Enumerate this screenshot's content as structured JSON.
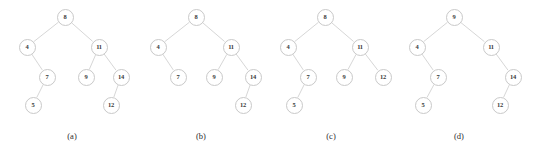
{
  "figure": {
    "background_color": "#ffffff",
    "node_fill": "#ffffff",
    "node_stroke": "#c9c9c9",
    "edge_color": "#cccccc",
    "text_color": "#3a3a3a",
    "width": 539,
    "height": 151
  },
  "chart_data": {
    "type": "diagram",
    "subtype": "binary-search-tree",
    "title": "",
    "panel_count": 4,
    "panels": [
      {
        "caption": "(a)",
        "caption_x": 72,
        "caption_y": 131,
        "root": "8",
        "nodes": [
          {
            "id": "a8",
            "label": "8",
            "x": 65,
            "y": 17
          },
          {
            "id": "a4",
            "label": "4",
            "x": 27,
            "y": 47
          },
          {
            "id": "a11",
            "label": "11",
            "x": 99,
            "y": 47
          },
          {
            "id": "a7",
            "label": "7",
            "x": 47,
            "y": 77
          },
          {
            "id": "a9",
            "label": "9",
            "x": 86,
            "y": 77
          },
          {
            "id": "a14",
            "label": "14",
            "x": 121,
            "y": 77
          },
          {
            "id": "a5",
            "label": "5",
            "x": 33,
            "y": 105
          },
          {
            "id": "a12",
            "label": "12",
            "x": 111,
            "y": 105
          }
        ],
        "edges": [
          {
            "from": "a8",
            "to": "a4"
          },
          {
            "from": "a8",
            "to": "a11"
          },
          {
            "from": "a4",
            "to": "a7"
          },
          {
            "from": "a11",
            "to": "a9"
          },
          {
            "from": "a11",
            "to": "a14"
          },
          {
            "from": "a7",
            "to": "a5"
          },
          {
            "from": "a14",
            "to": "a12"
          }
        ]
      },
      {
        "caption": "(b)",
        "caption_x": 201,
        "caption_y": 131,
        "root": "8",
        "nodes": [
          {
            "id": "b8",
            "label": "8",
            "x": 196,
            "y": 17
          },
          {
            "id": "b4",
            "label": "4",
            "x": 158,
            "y": 47
          },
          {
            "id": "b11",
            "label": "11",
            "x": 231,
            "y": 47
          },
          {
            "id": "b7",
            "label": "7",
            "x": 178,
            "y": 77
          },
          {
            "id": "b9",
            "label": "9",
            "x": 214,
            "y": 77
          },
          {
            "id": "b14",
            "label": "14",
            "x": 253,
            "y": 77
          },
          {
            "id": "b12",
            "label": "12",
            "x": 243,
            "y": 105
          }
        ],
        "edges": [
          {
            "from": "b8",
            "to": "b4"
          },
          {
            "from": "b8",
            "to": "b11"
          },
          {
            "from": "b4",
            "to": "b7"
          },
          {
            "from": "b11",
            "to": "b9"
          },
          {
            "from": "b11",
            "to": "b14"
          },
          {
            "from": "b14",
            "to": "b12"
          }
        ]
      },
      {
        "caption": "(c)",
        "caption_x": 331,
        "caption_y": 131,
        "root": "8",
        "nodes": [
          {
            "id": "c8",
            "label": "8",
            "x": 325,
            "y": 17
          },
          {
            "id": "c4",
            "label": "4",
            "x": 288,
            "y": 47
          },
          {
            "id": "c11",
            "label": "11",
            "x": 360,
            "y": 47
          },
          {
            "id": "c7",
            "label": "7",
            "x": 308,
            "y": 77
          },
          {
            "id": "c9",
            "label": "9",
            "x": 344,
            "y": 77
          },
          {
            "id": "c12",
            "label": "12",
            "x": 383,
            "y": 77
          },
          {
            "id": "c5",
            "label": "5",
            "x": 294,
            "y": 105
          }
        ],
        "edges": [
          {
            "from": "c8",
            "to": "c4"
          },
          {
            "from": "c8",
            "to": "c11"
          },
          {
            "from": "c4",
            "to": "c7"
          },
          {
            "from": "c11",
            "to": "c9"
          },
          {
            "from": "c11",
            "to": "c12"
          },
          {
            "from": "c7",
            "to": "c5"
          }
        ]
      },
      {
        "caption": "(d)",
        "caption_x": 459,
        "caption_y": 131,
        "root": "9",
        "nodes": [
          {
            "id": "d9",
            "label": "9",
            "x": 454,
            "y": 17
          },
          {
            "id": "d4",
            "label": "4",
            "x": 417,
            "y": 47
          },
          {
            "id": "d11",
            "label": "11",
            "x": 491,
            "y": 47
          },
          {
            "id": "d7",
            "label": "7",
            "x": 438,
            "y": 77
          },
          {
            "id": "d14",
            "label": "14",
            "x": 513,
            "y": 77
          },
          {
            "id": "d5",
            "label": "5",
            "x": 423,
            "y": 105
          },
          {
            "id": "d12",
            "label": "12",
            "x": 500,
            "y": 105
          }
        ],
        "edges": [
          {
            "from": "d9",
            "to": "d4"
          },
          {
            "from": "d9",
            "to": "d11"
          },
          {
            "from": "d4",
            "to": "d7"
          },
          {
            "from": "d11",
            "to": "d14"
          },
          {
            "from": "d7",
            "to": "d5"
          },
          {
            "from": "d14",
            "to": "d12"
          }
        ]
      }
    ]
  }
}
